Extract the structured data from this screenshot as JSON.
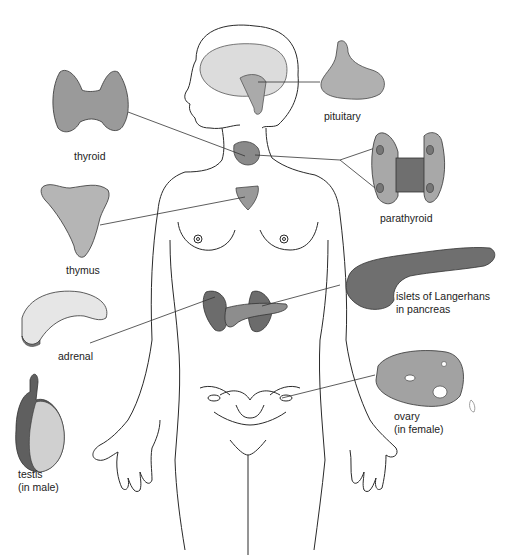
{
  "diagram": {
    "labels": {
      "pituitary": "pituitary",
      "thyroid": "thyroid",
      "parathyroid": "parathyroid",
      "thymus": "thymus",
      "pancreas_line1": "islets of Langerhans",
      "pancreas_line2": "in pancreas",
      "adrenal": "adrenal",
      "ovary_line1": "ovary",
      "ovary_line2": "(in female)",
      "testis_line1": "testis",
      "testis_line2": "(in male)"
    },
    "colors": {
      "gland_light": "#bdbdbd",
      "gland_mid": "#9a9a9a",
      "gland_dark": "#6e6e6e",
      "outline": "#2a2a2a"
    }
  }
}
